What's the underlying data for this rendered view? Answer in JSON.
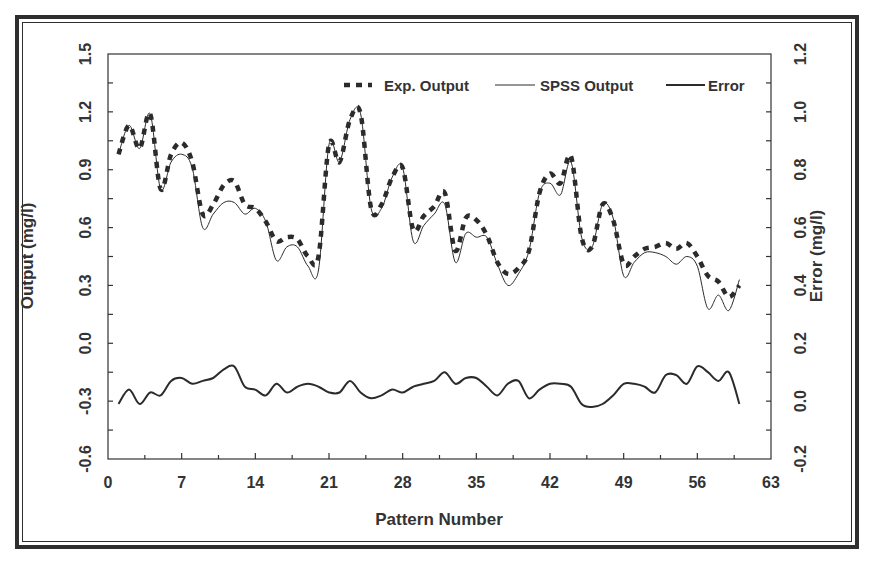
{
  "chart_data": {
    "type": "line",
    "title": "",
    "xlabel": "Pattern Number",
    "ylabel": "Output (mg/l)",
    "y2label": "Error (mg/l)",
    "xlim": [
      0,
      63
    ],
    "ylim": [
      -0.6,
      1.5
    ],
    "y2lim": [
      -0.2,
      1.2
    ],
    "x_ticks": [
      0,
      7,
      14,
      21,
      28,
      35,
      42,
      49,
      56,
      63
    ],
    "x_tick_labels": [
      "0",
      "7",
      "14",
      "21",
      "28",
      "35",
      "42",
      "49",
      "56",
      "63"
    ],
    "y_ticks": [
      -0.6,
      -0.3,
      0.0,
      0.3,
      0.6,
      0.9,
      1.2,
      1.5
    ],
    "y_tick_labels": [
      "-0.6",
      "-0.3",
      "0.0",
      "0.3",
      "0.6",
      "0.9",
      "1.2",
      "1.5"
    ],
    "y2_ticks": [
      -0.2,
      0.0,
      0.2,
      0.4,
      0.6,
      0.8,
      1.0,
      1.2
    ],
    "y2_tick_labels": [
      "-0.2",
      "0.0",
      "0.2",
      "0.4",
      "0.6",
      "0.8",
      "1.0",
      "1.2"
    ],
    "grid": false,
    "legend_position": "top-right inside",
    "x": [
      1,
      2,
      3,
      4,
      5,
      6,
      7,
      8,
      9,
      10,
      11,
      12,
      13,
      14,
      15,
      16,
      17,
      18,
      19,
      20,
      21,
      22,
      23,
      24,
      25,
      26,
      27,
      28,
      29,
      30,
      31,
      32,
      33,
      34,
      35,
      36,
      37,
      38,
      39,
      40,
      41,
      42,
      43,
      44,
      45,
      46,
      47,
      48,
      49,
      50,
      51,
      52,
      53,
      54,
      55,
      56,
      57,
      58,
      59,
      60
    ],
    "series": [
      {
        "name": "Exp. Output",
        "axis": "left",
        "style": "dashed-thick",
        "values": [
          0.98,
          1.13,
          1.01,
          1.19,
          0.8,
          0.98,
          1.04,
          0.94,
          0.67,
          0.72,
          0.82,
          0.84,
          0.72,
          0.7,
          0.63,
          0.53,
          0.55,
          0.54,
          0.45,
          0.45,
          1.03,
          0.94,
          1.16,
          1.19,
          0.7,
          0.72,
          0.86,
          0.91,
          0.59,
          0.66,
          0.71,
          0.78,
          0.48,
          0.65,
          0.64,
          0.56,
          0.42,
          0.36,
          0.39,
          0.48,
          0.78,
          0.88,
          0.83,
          0.97,
          0.55,
          0.5,
          0.72,
          0.64,
          0.41,
          0.45,
          0.49,
          0.5,
          0.52,
          0.49,
          0.52,
          0.45,
          0.35,
          0.32,
          0.24,
          0.3
        ]
      },
      {
        "name": "SPSS Output",
        "axis": "left",
        "style": "thin",
        "values": [
          0.98,
          1.13,
          1.01,
          1.19,
          0.8,
          0.94,
          0.98,
          0.91,
          0.6,
          0.67,
          0.73,
          0.73,
          0.67,
          0.7,
          0.63,
          0.43,
          0.5,
          0.5,
          0.4,
          0.38,
          1.03,
          0.94,
          1.16,
          1.19,
          0.7,
          0.7,
          0.86,
          0.91,
          0.53,
          0.61,
          0.67,
          0.72,
          0.42,
          0.57,
          0.55,
          0.55,
          0.41,
          0.3,
          0.36,
          0.48,
          0.78,
          0.83,
          0.77,
          0.94,
          0.55,
          0.5,
          0.72,
          0.65,
          0.35,
          0.42,
          0.47,
          0.47,
          0.45,
          0.41,
          0.45,
          0.4,
          0.18,
          0.25,
          0.17,
          0.33
        ]
      },
      {
        "name": "Error",
        "axis": "right",
        "style": "medium",
        "values": [
          -0.01,
          0.04,
          -0.01,
          0.03,
          0.02,
          0.07,
          0.08,
          0.06,
          0.07,
          0.08,
          0.11,
          0.12,
          0.05,
          0.04,
          0.02,
          0.06,
          0.03,
          0.05,
          0.06,
          0.05,
          0.03,
          0.03,
          0.07,
          0.03,
          0.01,
          0.02,
          0.04,
          0.03,
          0.05,
          0.06,
          0.07,
          0.1,
          0.06,
          0.08,
          0.08,
          0.05,
          0.02,
          0.06,
          0.07,
          0.01,
          0.04,
          0.06,
          0.06,
          0.05,
          -0.01,
          -0.02,
          -0.01,
          0.02,
          0.06,
          0.06,
          0.05,
          0.03,
          0.09,
          0.09,
          0.06,
          0.12,
          0.1,
          0.07,
          0.1,
          -0.01
        ]
      }
    ]
  },
  "legend": {
    "items": [
      {
        "label": "Exp. Output"
      },
      {
        "label": "SPSS Output"
      },
      {
        "label": "Error"
      }
    ]
  },
  "colors": {
    "line": "#2b2b2b",
    "frame": "#333333",
    "text": "#333333"
  }
}
